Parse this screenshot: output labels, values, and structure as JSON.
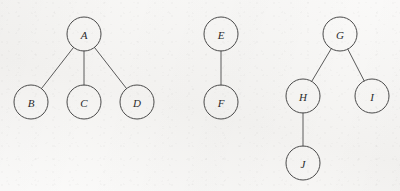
{
  "diagram": {
    "background_color": "#f6f5f3",
    "node_stroke_color": "#4a4a4a",
    "edge_stroke_color": "#5a5a5a",
    "label_color": "#2b2b2b",
    "node_radius": 17,
    "canvas": {
      "width": 400,
      "height": 191
    },
    "components": [
      {
        "name": "tree-a",
        "root": "A",
        "nodes": [
          {
            "id": "A",
            "label": "A",
            "cx": 84,
            "cy": 34
          },
          {
            "id": "B",
            "label": "B",
            "cx": 31,
            "cy": 102
          },
          {
            "id": "C",
            "label": "C",
            "cx": 84,
            "cy": 102
          },
          {
            "id": "D",
            "label": "D",
            "cx": 137,
            "cy": 102
          }
        ],
        "edges": [
          {
            "from": "A",
            "to": "B"
          },
          {
            "from": "A",
            "to": "C"
          },
          {
            "from": "A",
            "to": "D"
          }
        ]
      },
      {
        "name": "tree-e",
        "root": "E",
        "nodes": [
          {
            "id": "E",
            "label": "E",
            "cx": 221,
            "cy": 34
          },
          {
            "id": "F",
            "label": "F",
            "cx": 221,
            "cy": 102
          }
        ],
        "edges": [
          {
            "from": "E",
            "to": "F"
          }
        ]
      },
      {
        "name": "tree-g",
        "root": "G",
        "nodes": [
          {
            "id": "G",
            "label": "G",
            "cx": 340,
            "cy": 34
          },
          {
            "id": "H",
            "label": "H",
            "cx": 303,
            "cy": 96
          },
          {
            "id": "I",
            "label": "I",
            "cx": 372,
            "cy": 96
          },
          {
            "id": "J",
            "label": "J",
            "cx": 303,
            "cy": 163
          }
        ],
        "edges": [
          {
            "from": "G",
            "to": "H"
          },
          {
            "from": "G",
            "to": "I"
          },
          {
            "from": "H",
            "to": "J"
          }
        ]
      }
    ]
  }
}
